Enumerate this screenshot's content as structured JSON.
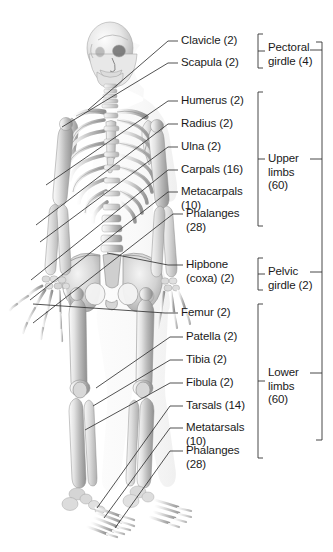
{
  "figure": {
    "background_color": "#ffffff",
    "line_color": "#333333",
    "text_color": "#1a1a1a"
  },
  "labels": [
    {
      "id": "clavicle",
      "text": "Clavicle (2)",
      "text2": "",
      "x": 181,
      "y": 34,
      "tick_x": 168,
      "tick_y": 41,
      "line_to_x": 88,
      "line_to_y": 110
    },
    {
      "id": "scapula",
      "text": "Scapula (2)",
      "text2": "",
      "x": 181,
      "y": 56,
      "tick_x": 168,
      "tick_y": 63,
      "line_to_x": 62,
      "line_to_y": 127
    },
    {
      "id": "humerus",
      "text": "Humerus (2)",
      "text2": "",
      "x": 181,
      "y": 94,
      "tick_x": 168,
      "tick_y": 101,
      "line_to_x": 46,
      "line_to_y": 185
    },
    {
      "id": "radius",
      "text": "Radius (2)",
      "text2": "",
      "x": 181,
      "y": 117,
      "tick_x": 168,
      "tick_y": 124,
      "line_to_x": 36,
      "line_to_y": 225
    },
    {
      "id": "ulna",
      "text": "Ulna (2)",
      "text2": "",
      "x": 181,
      "y": 140,
      "tick_x": 168,
      "tick_y": 147,
      "line_to_x": 40,
      "line_to_y": 242
    },
    {
      "id": "carpals",
      "text": "Carpals (16)",
      "text2": "",
      "x": 181,
      "y": 163,
      "tick_x": 168,
      "tick_y": 170,
      "line_to_x": 31,
      "line_to_y": 280
    },
    {
      "id": "metacarpals",
      "text": "Metacarpals",
      "text2": "(10)",
      "x": 181,
      "y": 185,
      "tick_x": 168,
      "tick_y": 192,
      "line_to_x": 30,
      "line_to_y": 300
    },
    {
      "id": "phalanges-hand",
      "text": "Phalanges",
      "text2": "(28)",
      "x": 186,
      "y": 207,
      "tick_x": 173,
      "tick_y": 214,
      "line_to_x": 33,
      "line_to_y": 323
    },
    {
      "id": "hipbone",
      "text": "Hipbone",
      "text2": "(coxa) (2)",
      "x": 186,
      "y": 258,
      "tick_x": 168,
      "tick_y": 265,
      "line_to_x": 107,
      "line_to_y": 253
    },
    {
      "id": "femur",
      "text": "Femur (2)",
      "text2": "",
      "x": 181,
      "y": 306,
      "tick_x": 165,
      "tick_y": 313,
      "line_to_x": 33,
      "line_to_y": 304
    },
    {
      "id": "patella",
      "text": "Patella (2)",
      "text2": "",
      "x": 186,
      "y": 330,
      "tick_x": 170,
      "tick_y": 337,
      "line_to_x": 96,
      "line_to_y": 388
    },
    {
      "id": "tibia",
      "text": "Tibia (2)",
      "text2": "",
      "x": 186,
      "y": 353,
      "tick_x": 170,
      "tick_y": 360,
      "line_to_x": 93,
      "line_to_y": 406
    },
    {
      "id": "fibula",
      "text": "Fibula (2)",
      "text2": "",
      "x": 186,
      "y": 376,
      "tick_x": 170,
      "tick_y": 383,
      "line_to_x": 85,
      "line_to_y": 430
    },
    {
      "id": "tarsals",
      "text": "Tarsals (14)",
      "text2": "",
      "x": 186,
      "y": 399,
      "tick_x": 170,
      "tick_y": 406,
      "line_to_x": 97,
      "line_to_y": 508
    },
    {
      "id": "metatarsals",
      "text": "Metatarsals",
      "text2": "(10)",
      "x": 186,
      "y": 421,
      "tick_x": 170,
      "tick_y": 428,
      "line_to_x": 104,
      "line_to_y": 518
    },
    {
      "id": "phalanges-foot",
      "text": "Phalanges",
      "text2": "(28)",
      "x": 186,
      "y": 444,
      "tick_x": 170,
      "tick_y": 451,
      "line_to_x": 115,
      "line_to_y": 528
    }
  ],
  "groups": [
    {
      "id": "pectoral-girdle",
      "line1": "Pectoral",
      "line2": "girdle (4)",
      "bracket_top": 34,
      "bracket_bottom": 68,
      "label_x": 268,
      "label_y": 41,
      "outer_tick_y": 50
    },
    {
      "id": "upper-limbs",
      "line1": "Upper",
      "line2": "limbs",
      "line3": "(60)",
      "bracket_top": 92,
      "bracket_bottom": 226,
      "label_x": 268,
      "label_y": 152,
      "outer_tick_y": 159
    },
    {
      "id": "pelvic-girdle",
      "line1": "Pelvic",
      "line2": "girdle (2)",
      "bracket_top": 258,
      "bracket_bottom": 290,
      "label_x": 268,
      "label_y": 265,
      "outer_tick_y": 272
    },
    {
      "id": "lower-limbs",
      "line1": "Lower",
      "line2": "limbs",
      "line3": "(60)",
      "bracket_top": 304,
      "bracket_bottom": 458,
      "label_x": 268,
      "label_y": 366,
      "outer_tick_y": 373
    }
  ],
  "outer_bracket": {
    "x": 322,
    "top": 42,
    "bottom": 440
  },
  "chart_data": {
    "type": "table",
    "categories": [
      "Clavicle",
      "Scapula",
      "Humerus",
      "Radius",
      "Ulna",
      "Carpals",
      "Metacarpals",
      "Phalanges (hand)",
      "Hipbone (coxa)",
      "Femur",
      "Patella",
      "Tibia",
      "Fibula",
      "Tarsals",
      "Metatarsals",
      "Phalanges (foot)"
    ],
    "values": [
      2,
      2,
      2,
      2,
      2,
      16,
      10,
      28,
      2,
      2,
      2,
      2,
      2,
      14,
      10,
      28
    ],
    "groups": [
      {
        "name": "Pectoral girdle",
        "total": 4,
        "members": [
          "Clavicle",
          "Scapula"
        ]
      },
      {
        "name": "Upper limbs",
        "total": 60,
        "members": [
          "Humerus",
          "Radius",
          "Ulna",
          "Carpals",
          "Metacarpals",
          "Phalanges (hand)"
        ]
      },
      {
        "name": "Pelvic girdle",
        "total": 2,
        "members": [
          "Hipbone (coxa)"
        ]
      },
      {
        "name": "Lower limbs",
        "total": 60,
        "members": [
          "Femur",
          "Patella",
          "Tibia",
          "Fibula",
          "Tarsals",
          "Metatarsals",
          "Phalanges (foot)"
        ]
      }
    ],
    "xlabel": "",
    "ylabel": ""
  }
}
